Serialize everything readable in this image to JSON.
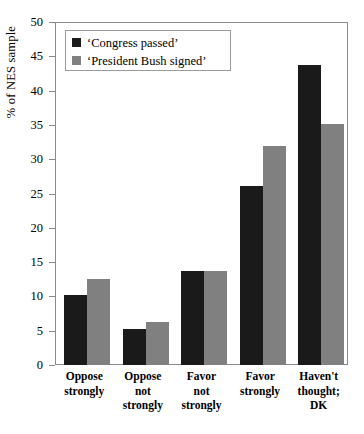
{
  "chart_data": {
    "type": "bar",
    "title": "",
    "xlabel": "",
    "ylabel": "% of NES sample",
    "ylim": [
      0,
      50
    ],
    "yticks": [
      0,
      5,
      10,
      15,
      20,
      25,
      30,
      35,
      40,
      45,
      50
    ],
    "grid": false,
    "legend_position": "top-left",
    "categories": [
      "Oppose strongly",
      "Oppose not strongly",
      "Favor not strongly",
      "Favor strongly",
      "Haven't thought; DK"
    ],
    "category_lines": [
      [
        "Oppose",
        "strongly"
      ],
      [
        "Oppose",
        "not",
        "strongly"
      ],
      [
        "Favor",
        "not",
        "strongly"
      ],
      [
        "Favor",
        "strongly"
      ],
      [
        "Haven't",
        "thought;",
        "DK"
      ]
    ],
    "series": [
      {
        "name": "‘Congress passed’",
        "color": "#1a1a1a",
        "values": [
          10.2,
          5.3,
          13.7,
          26.1,
          43.8
        ]
      },
      {
        "name": "‘President Bush signed’",
        "color": "#808080",
        "values": [
          12.5,
          6.3,
          13.7,
          31.9,
          35.1
        ]
      }
    ]
  },
  "axis": {
    "y_title": "% of NES sample"
  },
  "legend": {
    "entries": [
      {
        "label": "‘Congress passed’",
        "swatch": "series-a"
      },
      {
        "label": "‘President Bush signed’",
        "swatch": "series-b"
      }
    ]
  }
}
